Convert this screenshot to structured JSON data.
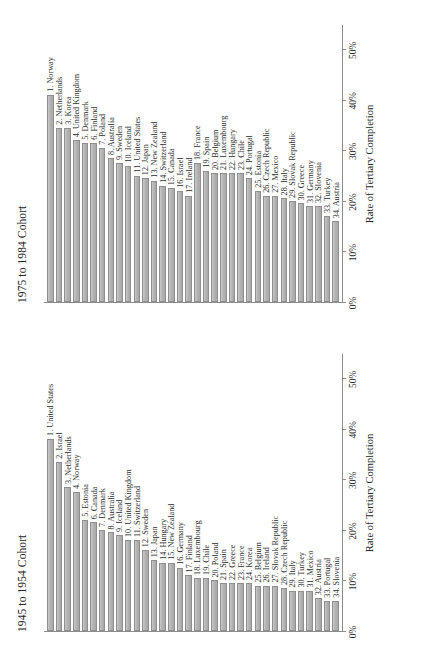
{
  "figure": {
    "axis_title": "Rate of Tertiary Completion",
    "bar_fill": "#b3b3b3",
    "bar_stroke": "#8f8f8f",
    "axis_color": "#8c8c8c"
  },
  "chart_data": [
    {
      "type": "bar",
      "title": "1945 to 1954 Cohort",
      "xlabel": "Rate of Tertiary Completion",
      "ylabel": "",
      "orientation": "vertical",
      "grid": false,
      "legend": "none",
      "xlim": [
        0,
        0.55
      ],
      "tick_labels": [
        "0%",
        "10%",
        "20%",
        "30%",
        "40%",
        "50%"
      ],
      "tick_values": [
        0,
        10,
        20,
        30,
        40,
        50
      ],
      "categories": [
        "1. United States",
        "2. Israel",
        "3. Netherlands",
        "4. Norway",
        "5. Estonia",
        "6. Canada",
        "7. Denmark",
        "8. Australia",
        "9. Iceland",
        "10. United Kingdom",
        "11. Switzerland",
        "12. Sweden",
        "13. Japan",
        "14. Hungary",
        "15. New Zealand",
        "16. Germany",
        "17. Finland",
        "18. Luxembourg",
        "19. Chile",
        "20. Poland",
        "21. Spain",
        "22. Greece",
        "23. France",
        "24. Korea",
        "25. Belgium",
        "26. Ireland",
        "27. Slovak Republic",
        "28. Czech Republic",
        "29. Italy",
        "30. Turkey",
        "31. Mexico",
        "32. Austria",
        "33. Portugal",
        "34. Slovenia"
      ],
      "values": [
        38.0,
        33.5,
        28.5,
        27.5,
        22.0,
        21.5,
        20.0,
        19.5,
        19.0,
        18.0,
        18.0,
        16.0,
        14.0,
        13.5,
        13.5,
        12.5,
        11.0,
        10.5,
        10.5,
        10.0,
        9.5,
        9.5,
        9.5,
        9.5,
        9.0,
        9.0,
        9.0,
        8.5,
        8.0,
        8.0,
        8.0,
        6.5,
        6.0,
        6.0
      ]
    },
    {
      "type": "bar",
      "title": "1975 to 1984 Cohort",
      "xlabel": "Rate of Tertiary Completion",
      "ylabel": "",
      "orientation": "vertical",
      "grid": false,
      "legend": "none",
      "xlim": [
        0,
        0.55
      ],
      "tick_labels": [
        "0%",
        "10%",
        "20%",
        "30%",
        "40%",
        "50%"
      ],
      "tick_values": [
        0,
        10,
        20,
        30,
        40,
        50
      ],
      "categories": [
        "1. Norway",
        "2. Netherlands",
        "3. Korea",
        "4. United Kingdom",
        "5. Denmark",
        "6. Finland",
        "7. Poland",
        "8. Australia",
        "9. Sweden",
        "10. Iceland",
        "11. United States",
        "12. Japan",
        "13. New Zealand",
        "14. Switzerland",
        "15. Canada",
        "16. Israel",
        "17. Ireland",
        "18. France",
        "19. Spain",
        "20. Belgium",
        "21. Luxembourg",
        "22. Hungary",
        "23. Chile",
        "24. Portugal",
        "25. Estonia",
        "26. Czech Republic",
        "27. Mexico",
        "28. Italy",
        "29. Slovak Republic",
        "30. Greece",
        "31. Germany",
        "32. Slovenia",
        "33. Turkey",
        "34. Austria"
      ],
      "values": [
        41.0,
        34.5,
        34.5,
        32.0,
        31.5,
        31.5,
        30.5,
        28.5,
        27.5,
        27.0,
        25.0,
        24.5,
        24.0,
        23.0,
        22.5,
        22.0,
        21.0,
        27.5,
        26.0,
        25.5,
        25.5,
        25.5,
        25.5,
        24.5,
        22.0,
        21.0,
        21.0,
        20.5,
        20.0,
        19.5,
        19.0,
        19.0,
        17.0,
        16.0
      ]
    }
  ]
}
